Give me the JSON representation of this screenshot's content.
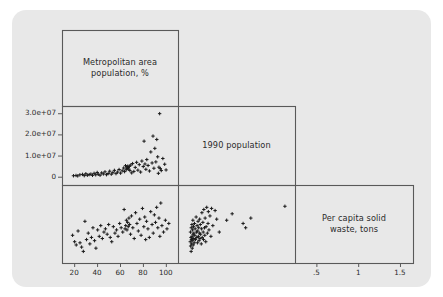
{
  "figure": {
    "type": "scatterplot-matrix",
    "background_color": "#ffffff",
    "card_color": "#e8e8e8",
    "frame_color": "#595959",
    "marker_color": "#1a1a1a",
    "text_color": "#2b2b2b"
  },
  "variables": [
    {
      "key": "metro",
      "label_line1": "Metropolitan area",
      "label_line2": "population, %"
    },
    {
      "key": "population",
      "label_line1": "1990 population",
      "label_line2": ""
    },
    {
      "key": "waste",
      "label_line1": "Per capita solid",
      "label_line2": "waste, tons"
    }
  ],
  "axes": {
    "y_left": {
      "for_row": 1,
      "ticks": [
        {
          "value": 0,
          "label": "0"
        },
        {
          "value": 10000000,
          "label": "1.0e+07"
        },
        {
          "value": 20000000,
          "label": "2.0e+07"
        },
        {
          "value": 30000000,
          "label": "3.0e+07"
        }
      ]
    },
    "x_bottom_col1": {
      "ticks": [
        {
          "value": 20,
          "label": "20"
        },
        {
          "value": 40,
          "label": "40"
        },
        {
          "value": 60,
          "label": "60"
        },
        {
          "value": 80,
          "label": "80"
        },
        {
          "value": 100,
          "label": "100"
        }
      ]
    },
    "x_bottom_col2": {
      "ticks": []
    },
    "x_bottom_col3": {
      "ticks": [
        {
          "value": 0.5,
          "label": ".5"
        },
        {
          "value": 1.0,
          "label": "1"
        },
        {
          "value": 1.5,
          "label": "1.5"
        }
      ]
    }
  },
  "chart_data": {
    "type": "scatter",
    "title": "",
    "subtitle": "",
    "layout": "lower-triangular scatterplot matrix, 3 variables, diagonal cells hold variable names",
    "grid": false,
    "legend": "none",
    "marker": "plus",
    "variables": [
      {
        "key": "metro",
        "name": "Metropolitan area population, %",
        "range": [
          12,
          108
        ]
      },
      {
        "key": "population",
        "name": "1990 population",
        "range": [
          -2500000,
          32000000
        ]
      },
      {
        "key": "waste",
        "name": "Per capita solid waste, tons",
        "range": [
          0.28,
          1.62
        ]
      }
    ],
    "panels": [
      {
        "row": 1,
        "col": 1,
        "xvar": "metro",
        "yvar": "population",
        "xlabel": "Metropolitan area population, %",
        "ylabel": "1990 population",
        "xlim": [
          12,
          108
        ],
        "ylim": [
          -2500000,
          32000000
        ],
        "points": [
          [
            19.4,
            450000
          ],
          [
            21.6,
            600000
          ],
          [
            23.1,
            380000
          ],
          [
            25.0,
            900000
          ],
          [
            27.3,
            1100000
          ],
          [
            28.8,
            500000
          ],
          [
            30.2,
            1400000
          ],
          [
            31.5,
            700000
          ],
          [
            33.1,
            1000000
          ],
          [
            34.6,
            1250000
          ],
          [
            36.0,
            650000
          ],
          [
            37.4,
            1600000
          ],
          [
            38.8,
            900000
          ],
          [
            40.1,
            2000000
          ],
          [
            41.0,
            1150000
          ],
          [
            42.6,
            700000
          ],
          [
            44.0,
            1800000
          ],
          [
            45.5,
            1300000
          ],
          [
            46.9,
            2300000
          ],
          [
            48.2,
            950000
          ],
          [
            49.7,
            1500000
          ],
          [
            51.0,
            2600000
          ],
          [
            52.4,
            1200000
          ],
          [
            53.8,
            1900000
          ],
          [
            55.1,
            3000000
          ],
          [
            56.5,
            1450000
          ],
          [
            57.9,
            2200000
          ],
          [
            59.2,
            3400000
          ],
          [
            60.5,
            1700000
          ],
          [
            61.9,
            2800000
          ],
          [
            63.2,
            4100000
          ],
          [
            64.0,
            2400000
          ],
          [
            64.8,
            5200000
          ],
          [
            65.4,
            3300000
          ],
          [
            65.9,
            4600000
          ],
          [
            66.3,
            3900000
          ],
          [
            66.8,
            5000000
          ],
          [
            67.2,
            4300000
          ],
          [
            67.7,
            3600000
          ],
          [
            68.1,
            4900000
          ],
          [
            68.6,
            2900000
          ],
          [
            69.4,
            5500000
          ],
          [
            70.2,
            1800000
          ],
          [
            71.0,
            6200000
          ],
          [
            72.1,
            2500000
          ],
          [
            73.3,
            4400000
          ],
          [
            74.5,
            6800000
          ],
          [
            75.6,
            3100000
          ],
          [
            76.8,
            5700000
          ],
          [
            78.0,
            2200000
          ],
          [
            79.1,
            7400000
          ],
          [
            80.3,
            4800000
          ],
          [
            81.0,
            16800000
          ],
          [
            81.8,
            6000000
          ],
          [
            82.6,
            3500000
          ],
          [
            83.4,
            8100000
          ],
          [
            84.5,
            5300000
          ],
          [
            85.7,
            2700000
          ],
          [
            86.9,
            11700000
          ],
          [
            88.0,
            6500000
          ],
          [
            88.8,
            19200000
          ],
          [
            89.6,
            4000000
          ],
          [
            90.4,
            13400000
          ],
          [
            91.3,
            7000000
          ],
          [
            92.1,
            17600000
          ],
          [
            92.9,
            9400000
          ],
          [
            93.5,
            1600000
          ],
          [
            94.0,
            4500000
          ],
          [
            94.6,
            29800000
          ],
          [
            95.2,
            3800000
          ],
          [
            96.0,
            2900000
          ],
          [
            97.4,
            8600000
          ],
          [
            99.0,
            5900000
          ],
          [
            100.2,
            3200000
          ]
        ]
      },
      {
        "row": 2,
        "col": 1,
        "xvar": "metro",
        "yvar": "waste",
        "xlabel": "Metropolitan area population, %",
        "ylabel": "Per capita solid waste, tons",
        "xlim": [
          12,
          108
        ],
        "ylim": [
          0.28,
          1.62
        ],
        "points": [
          [
            18.6,
            0.74
          ],
          [
            20.4,
            0.62
          ],
          [
            21.8,
            0.56
          ],
          [
            23.4,
            0.82
          ],
          [
            25.1,
            0.6
          ],
          [
            26.5,
            0.52
          ],
          [
            28.0,
            0.44
          ],
          [
            29.4,
            1.0
          ],
          [
            30.8,
            0.66
          ],
          [
            32.3,
            0.78
          ],
          [
            33.7,
            0.58
          ],
          [
            35.1,
            0.7
          ],
          [
            36.4,
            0.88
          ],
          [
            37.8,
            0.64
          ],
          [
            39.0,
            0.5
          ],
          [
            40.5,
            0.84
          ],
          [
            41.9,
            0.72
          ],
          [
            43.2,
            0.92
          ],
          [
            44.6,
            0.68
          ],
          [
            46.0,
            0.8
          ],
          [
            47.3,
            0.86
          ],
          [
            48.8,
            0.76
          ],
          [
            50.1,
            0.94
          ],
          [
            51.5,
            0.7
          ],
          [
            52.8,
            0.62
          ],
          [
            54.2,
            0.9
          ],
          [
            55.6,
            0.78
          ],
          [
            57.0,
            0.84
          ],
          [
            58.3,
            0.72
          ],
          [
            59.7,
            0.96
          ],
          [
            61.0,
            0.88
          ],
          [
            62.4,
            0.8
          ],
          [
            63.6,
            1.22
          ],
          [
            64.4,
            0.86
          ],
          [
            65.0,
            0.92
          ],
          [
            65.6,
            1.02
          ],
          [
            66.1,
            0.84
          ],
          [
            66.7,
            0.98
          ],
          [
            67.2,
            0.9
          ],
          [
            67.8,
            1.06
          ],
          [
            68.4,
            0.94
          ],
          [
            69.2,
            0.76
          ],
          [
            70.0,
            1.1
          ],
          [
            71.2,
            0.88
          ],
          [
            72.4,
            0.68
          ],
          [
            73.6,
            1.16
          ],
          [
            74.8,
            0.96
          ],
          [
            76.0,
            0.82
          ],
          [
            77.2,
            1.04
          ],
          [
            78.4,
            0.74
          ],
          [
            79.6,
            1.24
          ],
          [
            80.8,
            0.9
          ],
          [
            81.6,
            1.08
          ],
          [
            82.4,
            0.66
          ],
          [
            83.2,
            1.0
          ],
          [
            84.4,
            0.86
          ],
          [
            85.6,
            0.7
          ],
          [
            86.8,
            1.18
          ],
          [
            88.0,
            0.94
          ],
          [
            89.0,
            0.78
          ],
          [
            90.0,
            1.12
          ],
          [
            91.0,
            0.98
          ],
          [
            92.0,
            1.26
          ],
          [
            93.0,
            0.88
          ],
          [
            94.0,
            1.06
          ],
          [
            94.8,
            0.72
          ],
          [
            95.6,
            1.34
          ],
          [
            96.6,
            0.92
          ],
          [
            98.0,
            0.8
          ],
          [
            99.6,
            1.02
          ],
          [
            101.0,
            0.86
          ],
          [
            102.6,
            0.96
          ]
        ]
      },
      {
        "row": 2,
        "col": 2,
        "xvar": "population",
        "yvar": "waste",
        "xlabel": "1990 population",
        "ylabel": "Per capita solid waste, tons",
        "xlim": [
          -2500000,
          32000000
        ],
        "ylim": [
          0.28,
          1.62
        ],
        "points": [
          [
            380000,
            0.62
          ],
          [
            450000,
            0.8
          ],
          [
            500000,
            0.54
          ],
          [
            600000,
            0.7
          ],
          [
            650000,
            0.44
          ],
          [
            700000,
            0.88
          ],
          [
            750000,
            0.66
          ],
          [
            800000,
            0.58
          ],
          [
            900000,
            0.94
          ],
          [
            950000,
            0.72
          ],
          [
            1000000,
            0.5
          ],
          [
            1100000,
            0.84
          ],
          [
            1150000,
            0.64
          ],
          [
            1200000,
            1.02
          ],
          [
            1250000,
            0.76
          ],
          [
            1300000,
            0.56
          ],
          [
            1400000,
            0.9
          ],
          [
            1450000,
            0.68
          ],
          [
            1500000,
            0.78
          ],
          [
            1600000,
            0.6
          ],
          [
            1700000,
            0.96
          ],
          [
            1800000,
            0.74
          ],
          [
            1900000,
            0.86
          ],
          [
            2000000,
            0.66
          ],
          [
            2200000,
            1.08
          ],
          [
            2300000,
            0.8
          ],
          [
            2400000,
            0.7
          ],
          [
            2500000,
            0.92
          ],
          [
            2600000,
            0.6
          ],
          [
            2700000,
            0.82
          ],
          [
            2800000,
            1.0
          ],
          [
            2900000,
            0.72
          ],
          [
            3000000,
            0.88
          ],
          [
            3100000,
            0.64
          ],
          [
            3200000,
            0.78
          ],
          [
            3300000,
            1.04
          ],
          [
            3400000,
            0.68
          ],
          [
            3500000,
            0.94
          ],
          [
            3600000,
            0.76
          ],
          [
            3800000,
            0.58
          ],
          [
            3900000,
            0.86
          ],
          [
            4000000,
            1.16
          ],
          [
            4100000,
            0.7
          ],
          [
            4300000,
            0.98
          ],
          [
            4400000,
            0.8
          ],
          [
            4500000,
            0.66
          ],
          [
            4600000,
            1.22
          ],
          [
            4800000,
            0.88
          ],
          [
            4900000,
            0.74
          ],
          [
            5000000,
            1.06
          ],
          [
            5200000,
            0.62
          ],
          [
            5300000,
            0.9
          ],
          [
            5500000,
            1.26
          ],
          [
            5700000,
            0.78
          ],
          [
            5900000,
            0.96
          ],
          [
            6000000,
            1.18
          ],
          [
            6200000,
            0.84
          ],
          [
            6500000,
            1.1
          ],
          [
            6800000,
            0.72
          ],
          [
            7000000,
            1.24
          ],
          [
            7400000,
            0.92
          ],
          [
            8100000,
            1.2
          ],
          [
            8600000,
            1.04
          ],
          [
            9400000,
            0.8
          ],
          [
            11700000,
            1.02
          ],
          [
            13400000,
            1.14
          ],
          [
            16800000,
            0.96
          ],
          [
            17600000,
            0.88
          ],
          [
            19200000,
            1.06
          ],
          [
            29800000,
            1.28
          ]
        ]
      }
    ],
    "diagonal_cells": [
      {
        "row": 0,
        "col": 0,
        "text_line1": "Metropolitan area",
        "text_line2": "population, %"
      },
      {
        "row": 1,
        "col": 1,
        "text_line1": "1990 population",
        "text_line2": ""
      },
      {
        "row": 2,
        "col": 2,
        "text_line1": "Per capita solid",
        "text_line2": "waste, tons"
      }
    ]
  }
}
